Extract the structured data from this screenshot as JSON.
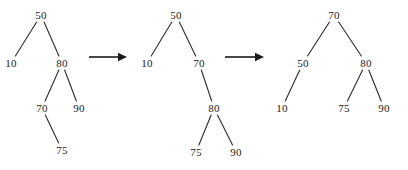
{
  "figure": {
    "background_color": "#ffffff",
    "ink_color": "#1a1a1a",
    "width": 408,
    "height": 170
  },
  "trees": [
    {
      "id": "tree-1",
      "caption": "",
      "nodes": [
        {
          "key": "node-50",
          "label": "50",
          "x": 41,
          "y": 15
        },
        {
          "key": "node-10",
          "label": "10",
          "x": 11,
          "y": 63
        },
        {
          "key": "node-80",
          "label": "80",
          "x": 62,
          "y": 63
        },
        {
          "key": "node-70",
          "label": "70",
          "x": 42,
          "y": 108
        },
        {
          "key": "node-90",
          "label": "90",
          "x": 79,
          "y": 108
        },
        {
          "key": "node-75",
          "label": "75",
          "x": 62,
          "y": 150
        }
      ],
      "edges": [
        {
          "from": "node-50",
          "to": "node-10"
        },
        {
          "from": "node-50",
          "to": "node-80"
        },
        {
          "from": "node-80",
          "to": "node-70"
        },
        {
          "from": "node-80",
          "to": "node-90"
        },
        {
          "from": "node-70",
          "to": "node-75"
        }
      ]
    },
    {
      "id": "tree-2",
      "caption": "",
      "nodes": [
        {
          "key": "node-50",
          "label": "50",
          "x": 176,
          "y": 15
        },
        {
          "key": "node-10",
          "label": "10",
          "x": 147,
          "y": 63
        },
        {
          "key": "node-70",
          "label": "70",
          "x": 199,
          "y": 63
        },
        {
          "key": "node-80",
          "label": "80",
          "x": 214,
          "y": 108
        },
        {
          "key": "node-75",
          "label": "75",
          "x": 196,
          "y": 152
        },
        {
          "key": "node-90",
          "label": "90",
          "x": 236,
          "y": 152
        }
      ],
      "edges": [
        {
          "from": "node-50",
          "to": "node-10"
        },
        {
          "from": "node-50",
          "to": "node-70"
        },
        {
          "from": "node-70",
          "to": "node-80"
        },
        {
          "from": "node-80",
          "to": "node-75"
        },
        {
          "from": "node-80",
          "to": "node-90"
        }
      ]
    },
    {
      "id": "tree-3",
      "caption": "",
      "nodes": [
        {
          "key": "node-70",
          "label": "70",
          "x": 334,
          "y": 15
        },
        {
          "key": "node-50",
          "label": "50",
          "x": 303,
          "y": 63
        },
        {
          "key": "node-80",
          "label": "80",
          "x": 366,
          "y": 63
        },
        {
          "key": "node-10",
          "label": "10",
          "x": 282,
          "y": 108
        },
        {
          "key": "node-75",
          "label": "75",
          "x": 344,
          "y": 108
        },
        {
          "key": "node-90",
          "label": "90",
          "x": 384,
          "y": 108
        }
      ],
      "edges": [
        {
          "from": "node-70",
          "to": "node-50"
        },
        {
          "from": "node-70",
          "to": "node-80"
        },
        {
          "from": "node-50",
          "to": "node-10"
        },
        {
          "from": "node-80",
          "to": "node-75"
        },
        {
          "from": "node-80",
          "to": "node-90"
        }
      ]
    }
  ],
  "arrows": [
    {
      "id": "arrow-1",
      "label": "",
      "x1": 89,
      "y1": 57,
      "x2": 127,
      "y2": 57
    },
    {
      "id": "arrow-2",
      "label": "",
      "x1": 225,
      "y1": 57,
      "x2": 264,
      "y2": 57
    }
  ]
}
